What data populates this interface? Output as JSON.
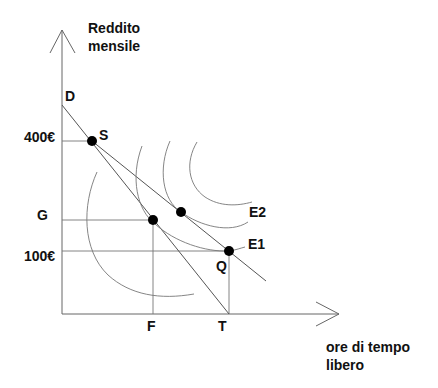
{
  "diagram": {
    "type": "labor-leisure choice (budget constraints and indifference curves)",
    "y_axis": {
      "title": "Reddito\nmensile"
    },
    "x_axis": {
      "title": "ore di tempo\nlibero"
    },
    "points": {
      "D": "D",
      "S": "S",
      "G": "G",
      "F": "F",
      "T": "T",
      "Q": "Q"
    },
    "y_ticks": {
      "high": "400€",
      "low": "100€"
    },
    "curves": {
      "E1": "E1",
      "E2": "E2"
    },
    "colors": {
      "line": "#555555",
      "dot": "#000000",
      "text": "#111111"
    }
  }
}
